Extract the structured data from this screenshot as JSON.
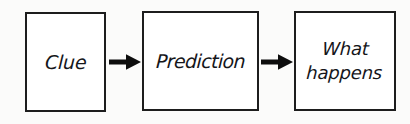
{
  "diagram": {
    "type": "flowchart",
    "orientation": "left-to-right",
    "background_color": "#fbfbfa",
    "node_fill_color": "#ffffff",
    "node_border_color": "#1d1d1d",
    "text_color": "#15161a",
    "arrow_color": "#0d0d0d",
    "nodes": [
      {
        "id": "clue",
        "label": "Clue"
      },
      {
        "id": "prediction",
        "label": "Prediction"
      },
      {
        "id": "outcome",
        "label": "What\nhappens"
      }
    ],
    "connectors": [
      {
        "id": "arrow-1",
        "from": "clue",
        "to": "prediction",
        "style": "solid-filled-arrowhead"
      },
      {
        "id": "arrow-2",
        "from": "prediction",
        "to": "outcome",
        "style": "solid-filled-arrowhead"
      }
    ]
  }
}
